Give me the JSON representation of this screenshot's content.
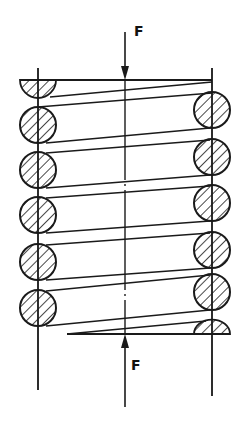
{
  "diagram": {
    "colors": {
      "stroke": "#1a1a1a",
      "background": "#ffffff",
      "hatch": "#1a1a1a"
    },
    "force_top": {
      "label": "F",
      "direction": "down",
      "x": 125,
      "y_start": 32,
      "y_end": 80,
      "label_x": 134,
      "label_y": 24
    },
    "force_bottom": {
      "label": "F",
      "direction": "up",
      "x": 125,
      "y_start": 407,
      "y_end": 334,
      "label_x": 131,
      "label_y": 358
    },
    "axes": {
      "left": {
        "x": 38,
        "y1": 68,
        "y2": 390
      },
      "right": {
        "x": 212,
        "y1": 68,
        "y2": 396
      },
      "center": {
        "x": 125,
        "y1": 80,
        "y2": 334,
        "style": "dash-dot"
      }
    },
    "wire_radius": 18,
    "left_circles_y": [
      125,
      170,
      215,
      262,
      308
    ],
    "right_circles_y": [
      110,
      157,
      203,
      250,
      292
    ],
    "top_end": {
      "flat_y": 80,
      "x1": 20,
      "x2": 212,
      "half_circle_cx": 38,
      "half_circle_cy": 80
    },
    "bottom_end": {
      "flat_y": 334,
      "x1": 67,
      "x2": 230,
      "half_circle_cx": 212,
      "half_circle_cy": 334
    }
  }
}
